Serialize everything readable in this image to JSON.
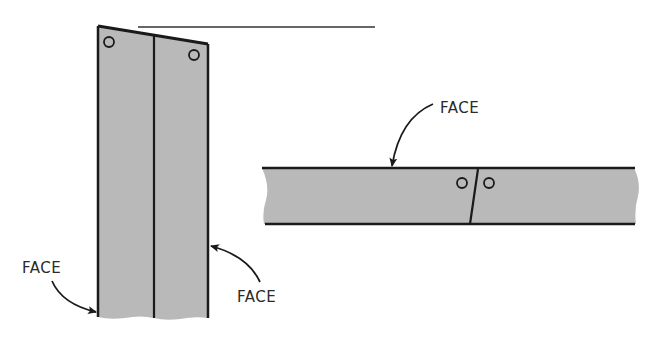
{
  "diagram": {
    "vertical_board": {
      "label_left": "FACE",
      "label_right": "FACE",
      "fill": "#b9b9b9",
      "stroke": "#1a1a1a"
    },
    "horizontal_board": {
      "label_top": "FACE",
      "fill": "#b9b9b9",
      "stroke": "#1a1a1a"
    },
    "reference_line": {
      "color": "#333333"
    }
  }
}
